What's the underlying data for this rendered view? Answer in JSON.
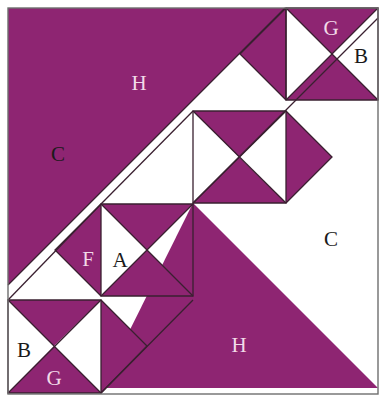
{
  "figure": {
    "name": "quilt-block-pattern",
    "width": 386,
    "height": 402,
    "background_color": "#FFFFFF",
    "purple_color": "#8E2572",
    "line_color": "#3A2030",
    "border_color": "#6E6E6E",
    "design_bounds": {
      "x": 8,
      "y": 8,
      "width": 370,
      "height": 386
    }
  },
  "labels": [
    {
      "id": "label-H-top",
      "text": "H",
      "x": 139,
      "y": 85,
      "on": "purple"
    },
    {
      "id": "label-G-top",
      "text": "G",
      "x": 331,
      "y": 30,
      "on": "purple"
    },
    {
      "id": "label-B-top",
      "text": "B",
      "x": 361,
      "y": 58,
      "on": "white"
    },
    {
      "id": "label-C-left",
      "text": "C",
      "x": 58,
      "y": 156,
      "on": "white"
    },
    {
      "id": "label-C-right",
      "text": "C",
      "x": 331,
      "y": 241,
      "on": "white"
    },
    {
      "id": "label-F",
      "text": "F",
      "x": 88,
      "y": 261,
      "on": "purple"
    },
    {
      "id": "label-A",
      "text": "A",
      "x": 120,
      "y": 262,
      "on": "white"
    },
    {
      "id": "label-B-bottom",
      "text": "B",
      "x": 24,
      "y": 352,
      "on": "white"
    },
    {
      "id": "label-G-bottom",
      "text": "G",
      "x": 54,
      "y": 380,
      "on": "purple"
    },
    {
      "id": "label-H-bottom",
      "text": "H",
      "x": 239,
      "y": 347,
      "on": "purple"
    }
  ],
  "shapes": {
    "purple_regions": [
      {
        "id": "triangle-H-top",
        "points": "8,8 285,8 8,285"
      },
      {
        "id": "triangle-H-bottom",
        "points": "193,203 378,388 101,388"
      },
      {
        "id": "tr-topright-upper",
        "points": "286,8 378,8 332,54"
      },
      {
        "id": "tr-topright-lower",
        "points": "286,100 378,100 332,54"
      },
      {
        "id": "tr-cell34-left",
        "points": "286,100 286,8 240,54"
      },
      {
        "id": "tr-mid-upper",
        "points": "193,111 286,111 239,157"
      },
      {
        "id": "tr-mid-lower",
        "points": "193,203 286,203 239,157"
      },
      {
        "id": "tr-right-of-mid",
        "points": "286,111 286,203 332,157"
      },
      {
        "id": "tr-low-upper",
        "points": "101,204 193,204 147,250"
      },
      {
        "id": "tr-low-lower",
        "points": "101,296 193,296 147,250"
      },
      {
        "id": "tr-F",
        "points": "101,204 101,296 55,250"
      },
      {
        "id": "tr-bl-upper",
        "points": "8,300 101,300 54,346"
      },
      {
        "id": "tr-bl-lower",
        "points": "8,393 101,393 54,346"
      },
      {
        "id": "tr-right-of-bl",
        "points": "101,300 101,393 147,346"
      }
    ],
    "outline_paths": [
      {
        "id": "diag-main",
        "d": "M8,285 L285,8"
      },
      {
        "id": "diag-lower",
        "d": "M8,300 L101,204"
      },
      {
        "id": "diag-mid-low",
        "d": "M101,204 L193,111"
      },
      {
        "id": "diag-long-right",
        "d": "M193,203 L378,18"
      },
      {
        "id": "diag-bl-to-mid",
        "d": "M101,393 L193,300"
      },
      {
        "id": "square-mid",
        "d": "M193,111 L286,111 L286,203 L193,203 Z"
      },
      {
        "id": "square-low",
        "d": "M101,204 L193,204 L193,296 L101,296 Z"
      },
      {
        "id": "square-bl",
        "d": "M8,300 L101,300 L101,393 L8,393 Z"
      },
      {
        "id": "square-tr",
        "d": "M286,8 L378,8 L378,100 L286,100 Z"
      },
      {
        "id": "cross-mid-1",
        "d": "M193,111 L286,203"
      },
      {
        "id": "cross-mid-2",
        "d": "M286,111 L193,203"
      },
      {
        "id": "cross-low-1",
        "d": "M101,204 L193,296"
      },
      {
        "id": "cross-low-2",
        "d": "M193,204 L101,296"
      },
      {
        "id": "cross-bl-1",
        "d": "M8,300 L101,393"
      },
      {
        "id": "cross-bl-2",
        "d": "M101,300 L8,393"
      },
      {
        "id": "cross-tr-1",
        "d": "M286,8 L378,100"
      },
      {
        "id": "cross-tr-2",
        "d": "M378,8 L286,100"
      },
      {
        "id": "edge-cell34",
        "d": "M286,8 L286,100"
      },
      {
        "id": "edge-right-mid",
        "d": "M286,111 L332,157 L286,203"
      },
      {
        "id": "edge-right-bl",
        "d": "M101,300 L147,346 L101,393"
      },
      {
        "id": "edge-F",
        "d": "M101,204 L55,250 L101,296"
      },
      {
        "id": "edge-cell34-in",
        "d": "M286,8 L240,54 L286,100"
      }
    ]
  }
}
